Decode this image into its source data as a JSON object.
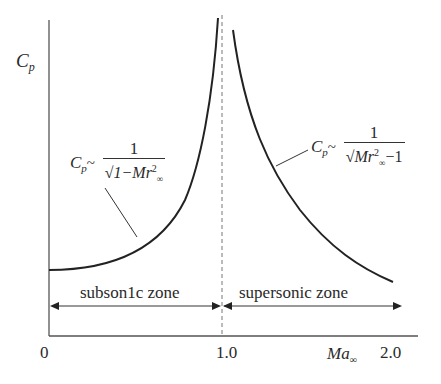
{
  "diagram": {
    "y_axis_label": "C",
    "y_axis_label_sub": "p",
    "x_axis_label": "Ma",
    "x_axis_label_sub": "∞",
    "x_ticks": [
      "0",
      "1.0",
      "2.0"
    ],
    "zones": {
      "subsonic": "subson1c zone",
      "supersonic": "supersonic zone"
    },
    "subsonic_formula": {
      "lhs": "C",
      "lhs_sub": "p",
      "relation": "~",
      "numerator": "1",
      "denominator_prefix": "√1−Mr",
      "exp": "2",
      "sub": "∞",
      "denominator_suffix": ""
    },
    "supersonic_formula": {
      "lhs": "C",
      "lhs_sub": "p",
      "relation": "~",
      "numerator": "1",
      "denominator_prefix": "√Mr",
      "exp": "2",
      "sub": "∞",
      "denominator_suffix": "−1"
    },
    "colors": {
      "line": "#222222",
      "axis": "#555555",
      "dashed": "#777777"
    }
  }
}
